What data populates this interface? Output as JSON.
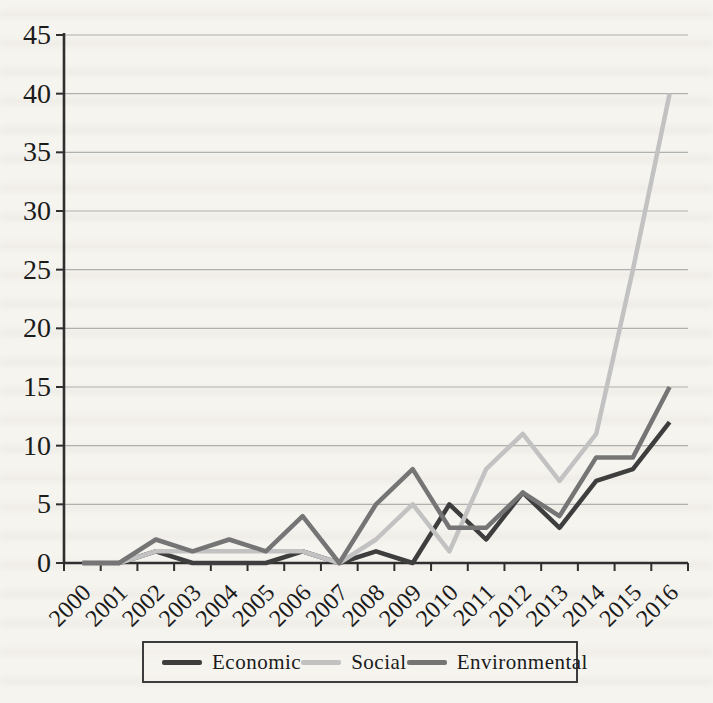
{
  "figure": {
    "kind": "scanned-book-line-chart",
    "paper_color": "#f6f4ef"
  },
  "chart_data": {
    "type": "line",
    "title": "",
    "xlabel": "",
    "ylabel": "",
    "categories": [
      "2000",
      "2001",
      "2002",
      "2003",
      "2004",
      "2005",
      "2006",
      "2007",
      "2008",
      "2009",
      "2010",
      "2011",
      "2012",
      "2013",
      "2014",
      "2015",
      "2016"
    ],
    "series": [
      {
        "name": "Economic",
        "color": "#3e3e3e",
        "stroke_width": 4.5,
        "values": [
          0,
          0,
          1,
          0,
          0,
          0,
          1,
          0,
          1,
          0,
          5,
          2,
          6,
          3,
          7,
          8,
          12
        ]
      },
      {
        "name": "Social",
        "color": "#c2c2c2",
        "stroke_width": 4.5,
        "values": [
          0,
          0,
          1,
          1,
          1,
          1,
          1,
          0,
          2,
          5,
          1,
          8,
          11,
          7,
          11,
          25,
          40
        ]
      },
      {
        "name": "Environmental",
        "color": "#757575",
        "stroke_width": 4.5,
        "values": [
          0,
          0,
          2,
          1,
          2,
          1,
          4,
          0,
          5,
          8,
          3,
          3,
          6,
          4,
          9,
          9,
          15
        ]
      }
    ],
    "ylim": [
      0,
      45
    ],
    "yticks": [
      0,
      5,
      10,
      15,
      20,
      25,
      30,
      35,
      40,
      45
    ],
    "grid": "horizontal",
    "legend_position": "bottom-center",
    "styling": {
      "axis_color": "#2f2f2f",
      "gridline_color": "#a5a5a5",
      "tick_label_color": "#1b1b1b",
      "y_tick_font_px": 28,
      "x_tick_font_px": 24,
      "x_label_rotation_deg": -45
    }
  },
  "legend": {
    "border_color": "#3c3c3c"
  }
}
